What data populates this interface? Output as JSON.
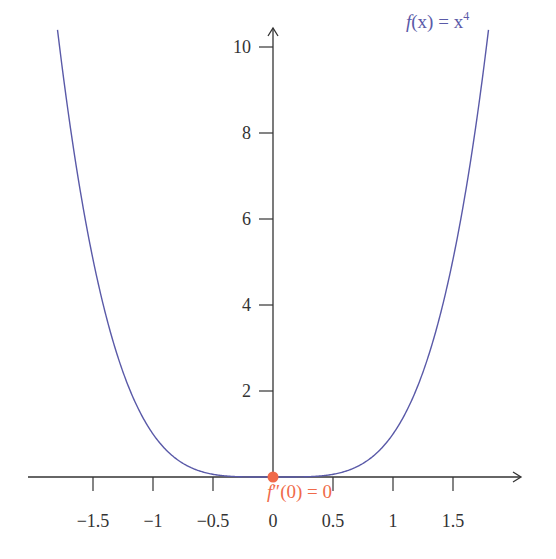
{
  "chart_data": {
    "type": "line",
    "title": "",
    "xlabel": "",
    "ylabel": "",
    "xlim": [
      -1.85,
      1.85
    ],
    "ylim": [
      0,
      10.5
    ],
    "grid": false,
    "x_ticks": [
      -1.5,
      -1,
      -0.5,
      0,
      0.5,
      1,
      1.5
    ],
    "x_tick_labels": [
      "−1.5",
      "−1",
      "−0.5",
      "0",
      "0.5",
      "1",
      "1.5"
    ],
    "y_ticks": [
      2,
      4,
      6,
      8,
      10
    ],
    "y_tick_labels": [
      "2",
      "4",
      "6",
      "8",
      "10"
    ],
    "series": [
      {
        "name": "f(x) = x^4",
        "function": "x^4",
        "color": "#5a5aa8",
        "x": [
          -1.8,
          -1.5,
          -1.0,
          -0.5,
          0,
          0.5,
          1.0,
          1.5,
          1.8
        ],
        "y": [
          10.5,
          5.06,
          1.0,
          0.0625,
          0,
          0.0625,
          1.0,
          5.06,
          10.5
        ]
      }
    ],
    "annotations": [
      {
        "text": "f(x) = x⁴",
        "position": "top-right",
        "color": "#5a5aa8"
      },
      {
        "text": "f″(0) = 0",
        "point": [
          0,
          0
        ],
        "color": "#f06a4a",
        "marker": "dot"
      }
    ]
  },
  "labels": {
    "function_label_f": "f",
    "function_label_paren": "(x) = x",
    "function_label_exp": "4",
    "point_label_f": "f",
    "point_label_rest": "″(0) = 0"
  },
  "colors": {
    "curve": "#5a5aa8",
    "axis": "#333333",
    "point": "#f06a4a"
  }
}
